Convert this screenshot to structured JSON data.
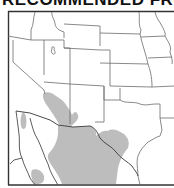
{
  "header": {
    "title": "RECOMMENDED FROM"
  },
  "map": {
    "region": "Southwestern United States and northern Mexico",
    "frame_color": "#333333",
    "border_color": "#6b6b6b",
    "range_color": "#bdbdbd",
    "background_color": "#ffffff",
    "legend": [
      {
        "label": "Range",
        "color": "#bdbdbd"
      }
    ],
    "features": [
      "state boundaries",
      "US-Mexico border",
      "Rio Grande",
      "Great Salt Lake outline",
      "Gulf of California coastline",
      "Baja California peninsula"
    ]
  }
}
